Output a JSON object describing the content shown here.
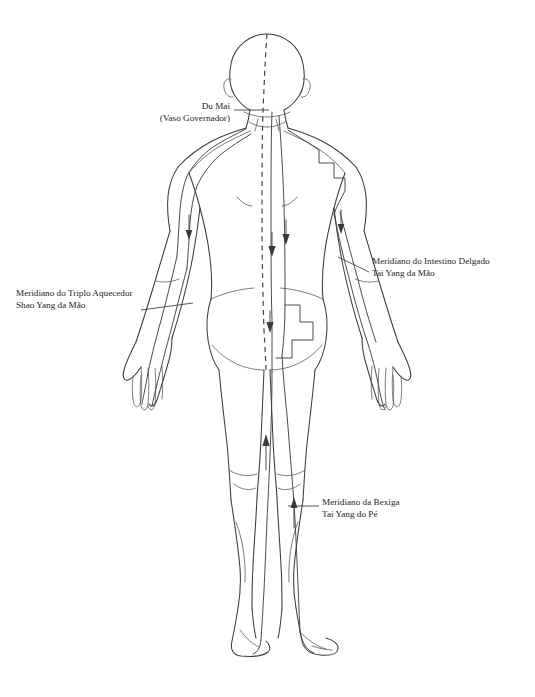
{
  "page": {
    "title_cropped": "",
    "background": "#ffffff",
    "ink_color": "#3a3a42",
    "width": 535,
    "height": 697
  },
  "figure": {
    "view": "posterior"
  },
  "annotations": [
    {
      "id": "du-mai",
      "line1": "Du Mai",
      "line2": "(Vaso Governador)",
      "meridian": "du-mai",
      "pathway": "midline-dashed",
      "leader_from": [
        232,
        110
      ],
      "leader_to": [
        268,
        110
      ]
    },
    {
      "id": "triplo-aquecedor",
      "line1": "Meridiano do Triplo Aquecedor",
      "line2": "Shao Yang da Mão",
      "meridian": "triple-burner",
      "pathway": "left-arm-posterior",
      "leader_from": [
        140,
        310
      ],
      "leader_to": [
        190,
        303
      ]
    },
    {
      "id": "intestino-delgado",
      "line1": "Meridiano do Intestino Delgado",
      "line2": "Tai Yang da Mão",
      "meridian": "small-intestine",
      "pathway": "right-arm-scapula",
      "leader_from": [
        370,
        272
      ],
      "leader_to": [
        338,
        258
      ]
    },
    {
      "id": "bexiga",
      "line1": "Meridiano da Bexiga",
      "line2": "Tai Yang do Pé",
      "meridian": "bladder",
      "pathway": "back-and-leg-posterior",
      "leader_from": [
        320,
        506
      ],
      "leader_to": [
        288,
        506
      ]
    }
  ],
  "meridian_flow_arrows": [
    {
      "id": "arrow-left-arm",
      "x": 190,
      "y": 228,
      "direction": "down"
    },
    {
      "id": "arrow-right-arm",
      "x": 341,
      "y": 222,
      "direction": "down"
    },
    {
      "id": "arrow-back-inner",
      "x": 275,
      "y": 243,
      "direction": "down"
    },
    {
      "id": "arrow-back-outer",
      "x": 291,
      "y": 233,
      "direction": "down"
    },
    {
      "id": "arrow-sacrum",
      "x": 269,
      "y": 325,
      "direction": "down"
    },
    {
      "id": "arrow-left-leg",
      "x": 264,
      "y": 452,
      "direction": "up"
    },
    {
      "id": "arrow-right-leg",
      "x": 296,
      "y": 512,
      "direction": "up"
    }
  ]
}
